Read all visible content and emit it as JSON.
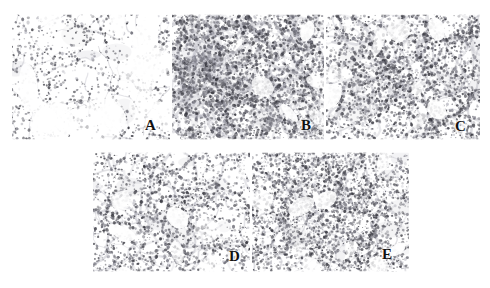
{
  "figure": {
    "kind": "histology-micrograph-panel",
    "background_color": "#ffffff",
    "width": 490,
    "height": 288,
    "rows": 2,
    "stain_description": "hematoxylin-and-eosin lung tissue sections",
    "label_color": "#111111",
    "tissue_dark_color": "#3a3a42",
    "tissue_mid_color": "#6e6e78",
    "tissue_light_color": "#b9b9c2"
  },
  "panels": [
    {
      "id": "panel-a",
      "label": "A",
      "row": 1,
      "column": 1,
      "x": 12,
      "y": 14,
      "width": 158,
      "height": 126,
      "label_x": 145,
      "label_y": 118,
      "density": "sparse",
      "seed": 11,
      "cluster_count": 54,
      "cell_count": 620,
      "septal_thickness": 1.0,
      "alveolar_openness": "wide open alveolar spaces, thin delicate septa"
    },
    {
      "id": "panel-b",
      "label": "B",
      "row": 1,
      "column": 2,
      "x": 172,
      "y": 14,
      "width": 152,
      "height": 126,
      "label_x": 301,
      "label_y": 118,
      "density": "dense",
      "seed": 27,
      "cluster_count": 150,
      "cell_count": 2100,
      "septal_thickness": 2.4,
      "alveolar_openness": "thickened septa, dense inflammatory infiltrate, collapsed spaces"
    },
    {
      "id": "panel-c",
      "label": "C",
      "row": 1,
      "column": 3,
      "x": 326,
      "y": 14,
      "width": 154,
      "height": 126,
      "label_x": 455,
      "label_y": 119,
      "density": "moderate-dense",
      "seed": 43,
      "cluster_count": 110,
      "cell_count": 1500,
      "septal_thickness": 2.0,
      "alveolar_openness": "moderately thickened septa with patchy infiltrate"
    },
    {
      "id": "panel-d",
      "label": "D",
      "row": 2,
      "column": 1,
      "x": 93,
      "y": 152,
      "width": 157,
      "height": 120,
      "label_x": 229,
      "label_y": 249,
      "density": "moderate",
      "seed": 61,
      "cluster_count": 84,
      "cell_count": 1150,
      "septal_thickness": 1.6,
      "alveolar_openness": "branching thickened septa, preserved open spaces"
    },
    {
      "id": "panel-e",
      "label": "E",
      "row": 2,
      "column": 2,
      "x": 252,
      "y": 152,
      "width": 157,
      "height": 120,
      "label_x": 382,
      "label_y": 247,
      "density": "moderate-fine",
      "seed": 79,
      "cluster_count": 130,
      "cell_count": 1750,
      "septal_thickness": 1.2,
      "alveolar_openness": "finely dispersed cellularity, narrow alveolar spaces"
    }
  ]
}
